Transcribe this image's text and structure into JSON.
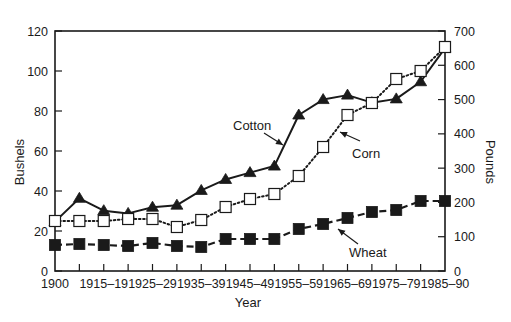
{
  "chart_data": {
    "type": "line",
    "title": "",
    "xlabel": "Year",
    "ylabel": "Bushels",
    "ylabel_right": "Pounds",
    "ylim": [
      0,
      120
    ],
    "ylim_right": [
      0,
      700
    ],
    "yticks": [
      0,
      20,
      40,
      60,
      80,
      100,
      120
    ],
    "yticks_right": [
      0,
      100,
      200,
      300,
      400,
      500,
      600,
      700
    ],
    "grid": false,
    "legend_position": "inline labels with arrows",
    "categories": [
      "1900",
      "",
      "1915–19",
      "",
      "1925–29",
      "",
      "1935–39",
      "",
      "1945–49",
      "",
      "1955–59",
      "",
      "1965–69",
      "",
      "1975–79",
      "",
      "1985–90"
    ],
    "series": [
      {
        "name": "Cotton",
        "axis": "right",
        "unit": "Pounds",
        "marker": "filled-triangle",
        "line": "solid",
        "values": [
          144,
          212,
          176,
          168,
          186,
          192,
          235,
          267,
          287,
          306,
          455,
          500,
          513,
          491,
          502,
          552,
          650
        ]
      },
      {
        "name": "Corn",
        "axis": "left",
        "unit": "Bushels",
        "marker": "open-square",
        "line": "dotted",
        "values": [
          25,
          25,
          25,
          26,
          26,
          22,
          25.5,
          32,
          36,
          38.5,
          47.5,
          62,
          78,
          84,
          96,
          100,
          112
        ]
      },
      {
        "name": "Wheat",
        "axis": "left",
        "unit": "Bushels",
        "marker": "filled-square",
        "line": "dashed",
        "values": [
          13,
          13.5,
          13,
          12.5,
          14,
          12.5,
          12,
          16,
          16,
          16,
          21,
          23.5,
          26.5,
          29.5,
          30.5,
          35,
          35
        ]
      }
    ],
    "annotations": [
      {
        "text": "Cotton",
        "x": 233,
        "y": 130
      },
      {
        "text": "Corn",
        "x": 352,
        "y": 158
      },
      {
        "text": "Wheat",
        "x": 349,
        "y": 257
      }
    ]
  },
  "colors": {
    "ink": "#1a1a1a",
    "background": "#ffffff"
  }
}
